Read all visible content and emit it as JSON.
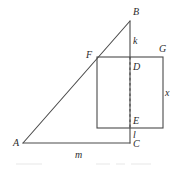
{
  "figure": {
    "type": "geometry-diagram",
    "stroke_color": "#4a4a4a",
    "label_color": "#2b2b2b",
    "background": "#ffffff",
    "points": {
      "A": {
        "label": "A",
        "x": 23,
        "y": 143,
        "label_x": 13,
        "label_y": 138
      },
      "B": {
        "label": "B",
        "x": 130,
        "y": 21,
        "label_x": 133,
        "label_y": 7
      },
      "C": {
        "label": "C",
        "x": 130,
        "y": 143,
        "label_x": 133,
        "label_y": 139
      },
      "D": {
        "label": "D",
        "x": 130,
        "y": 57,
        "label_x": 133,
        "label_y": 62
      },
      "E": {
        "label": "E",
        "x": 130,
        "y": 128,
        "label_x": 133,
        "label_y": 116
      },
      "F": {
        "label": "F",
        "x": 97,
        "y": 57,
        "label_x": 86,
        "label_y": 50
      },
      "G": {
        "label": "G",
        "x": 163,
        "y": 57,
        "label_x": 159,
        "label_y": 44
      }
    },
    "segments": {
      "hypotenuse": {
        "name": "A-B",
        "from": "A",
        "to": "B",
        "style": "solid"
      },
      "vertical_leg": {
        "name": "B-C",
        "from": "B",
        "to": "C",
        "style": "solid"
      },
      "base_leg": {
        "name": "A-C",
        "from": "A",
        "to": "C",
        "style": "solid"
      },
      "segment_DE": {
        "name": "D-E",
        "from": "D",
        "to": "E",
        "style": "dashed"
      }
    },
    "rectangle": {
      "name": "F-G-rectangle",
      "left": 97,
      "top": 57,
      "right": 163,
      "bottom": 128,
      "style": "solid"
    },
    "lengths": {
      "k": {
        "label": "k",
        "segment": "B-D",
        "label_x": 133,
        "label_y": 36
      },
      "x": {
        "label": "x",
        "segment": "G-bottom-right",
        "label_x": 165,
        "label_y": 88
      },
      "l": {
        "label": "l",
        "segment": "E-C",
        "label_x": 133,
        "label_y": 130
      },
      "m": {
        "label": "m",
        "segment": "A-C",
        "label_x": 75,
        "label_y": 150
      }
    }
  }
}
